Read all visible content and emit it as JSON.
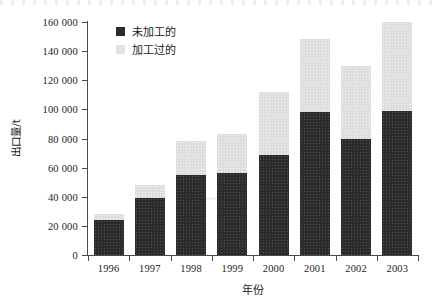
{
  "chart_data": {
    "type": "bar",
    "subtype": "stacked-bar",
    "title": "",
    "xlabel": "年份",
    "ylabel": "出口量/t",
    "categories": [
      "1996",
      "1997",
      "1998",
      "1999",
      "2000",
      "2001",
      "2002",
      "2003"
    ],
    "series": [
      {
        "name": "未加工的",
        "color": "#2b2b2b",
        "values": [
          24000,
          39000,
          55000,
          56000,
          69000,
          98000,
          80000,
          99000
        ]
      },
      {
        "name": "加工过的",
        "color": "#dedede",
        "values": [
          4000,
          9000,
          23000,
          27000,
          43000,
          50000,
          50000,
          61000
        ]
      }
    ],
    "totals": [
      28000,
      48000,
      78000,
      83000,
      112000,
      148000,
      130000,
      160000
    ],
    "ylim": [
      0,
      160000
    ],
    "ytick_values": [
      0,
      20000,
      40000,
      60000,
      80000,
      100000,
      120000,
      140000,
      160000
    ],
    "ytick_labels": [
      "0",
      "20 000",
      "40 000",
      "60 000",
      "80 000",
      "100 000",
      "120 000",
      "140 000",
      "160 000"
    ],
    "grid": false,
    "legend_position": "top-left-inside"
  },
  "legend": {
    "items": [
      {
        "label": "未加工的",
        "swatch": "dark-square-swatch"
      },
      {
        "label": "加工过的",
        "swatch": "light-square-swatch"
      }
    ]
  },
  "axes": {
    "y_title": "出口量/t",
    "x_title": "年份"
  }
}
